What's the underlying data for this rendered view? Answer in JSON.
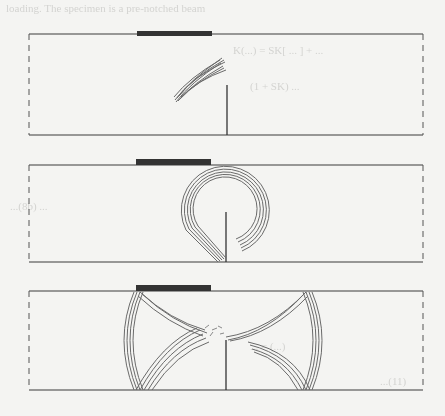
{
  "figure": {
    "panels": [
      {
        "id": "panel-1",
        "stage": "early",
        "pattern": "small inclined wave packet left of notch tip"
      },
      {
        "id": "panel-2",
        "stage": "middle",
        "pattern": "circular looping wavefront around notch"
      },
      {
        "id": "panel-3",
        "stage": "late",
        "pattern": "two symmetric hourglass-shaped wavefronts from bottom and top corners"
      }
    ],
    "colors": {
      "outline": "#3a3a3a",
      "pad": "#333333",
      "wave": "#6a6a6a",
      "background": "#f4f4f2"
    }
  },
  "bleed_text": [
    "loading. The specimen is a pre-notched beam",
    "K(...) = SK[ ... ] + ...",
    "(1 + SK)  ...",
    "...(8b)   ...",
    "... = (...)",
    "...(11)"
  ]
}
